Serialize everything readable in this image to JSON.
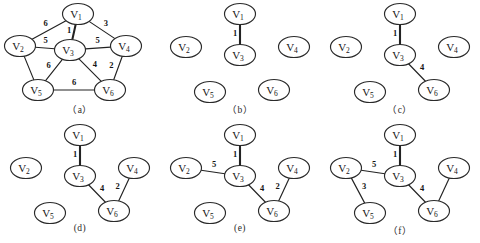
{
  "figure": {
    "background_color": "#ffffff",
    "ink_color": "#222222",
    "vertex_prefix": "V"
  },
  "vertices": [
    {
      "id": "V1",
      "label": "V",
      "sub": "1"
    },
    {
      "id": "V2",
      "label": "V",
      "sub": "2"
    },
    {
      "id": "V3",
      "label": "V",
      "sub": "3"
    },
    {
      "id": "V4",
      "label": "V",
      "sub": "4"
    },
    {
      "id": "V5",
      "label": "V",
      "sub": "5"
    },
    {
      "id": "V6",
      "label": "V",
      "sub": "6"
    }
  ],
  "panels": [
    {
      "key": "a",
      "caption": "（a）",
      "layout": "pentagon",
      "edges": [
        {
          "from": "V1",
          "to": "V2",
          "weight": "6",
          "selected": false
        },
        {
          "from": "V1",
          "to": "V3",
          "weight": "1",
          "selected": true
        },
        {
          "from": "V1",
          "to": "V4",
          "weight": "3",
          "selected": false
        },
        {
          "from": "V2",
          "to": "V3",
          "weight": "5",
          "selected": false
        },
        {
          "from": "V2",
          "to": "V5",
          "weight": "",
          "selected": false
        },
        {
          "from": "V3",
          "to": "V4",
          "weight": "5",
          "selected": false
        },
        {
          "from": "V3",
          "to": "V5",
          "weight": "6",
          "selected": false
        },
        {
          "from": "V3",
          "to": "V6",
          "weight": "4",
          "selected": false
        },
        {
          "from": "V4",
          "to": "V6",
          "weight": "2",
          "selected": false
        },
        {
          "from": "V5",
          "to": "V6",
          "weight": "6",
          "selected": false
        }
      ]
    },
    {
      "key": "b",
      "caption": "（b）",
      "layout": "grid",
      "edges": [
        {
          "from": "V1",
          "to": "V3",
          "weight": "1",
          "selected": true
        }
      ]
    },
    {
      "key": "c",
      "caption": "（c）",
      "layout": "grid",
      "edges": [
        {
          "from": "V1",
          "to": "V3",
          "weight": "1",
          "selected": true
        },
        {
          "from": "V3",
          "to": "V6",
          "weight": "4",
          "selected": false
        }
      ]
    },
    {
      "key": "d",
      "caption": "(d)",
      "layout": "grid",
      "edges": [
        {
          "from": "V1",
          "to": "V3",
          "weight": "1",
          "selected": true
        },
        {
          "from": "V3",
          "to": "V6",
          "weight": "4",
          "selected": false
        },
        {
          "from": "V4",
          "to": "V6",
          "weight": "2",
          "selected": false
        }
      ]
    },
    {
      "key": "e",
      "caption": "(e)",
      "layout": "grid",
      "edges": [
        {
          "from": "V1",
          "to": "V3",
          "weight": "1",
          "selected": true
        },
        {
          "from": "V2",
          "to": "V3",
          "weight": "5",
          "selected": false
        },
        {
          "from": "V3",
          "to": "V6",
          "weight": "4",
          "selected": false
        },
        {
          "from": "V4",
          "to": "V6",
          "weight": "2",
          "selected": false
        }
      ]
    },
    {
      "key": "f",
      "caption": "（f）",
      "layout": "grid",
      "edges": [
        {
          "from": "V1",
          "to": "V3",
          "weight": "1",
          "selected": true
        },
        {
          "from": "V2",
          "to": "V3",
          "weight": "5",
          "selected": false
        },
        {
          "from": "V2",
          "to": "V5",
          "weight": "3",
          "selected": false
        },
        {
          "from": "V3",
          "to": "V6",
          "weight": "4",
          "selected": false
        },
        {
          "from": "V4",
          "to": "V6",
          "weight": "",
          "selected": false
        }
      ]
    }
  ]
}
